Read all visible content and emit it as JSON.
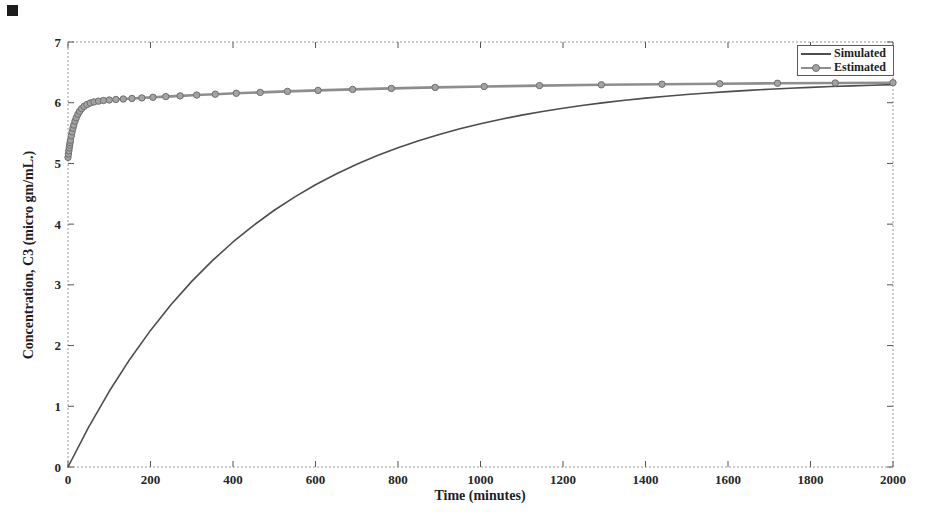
{
  "chart_data": {
    "type": "line",
    "title": "",
    "xlabel": "Time (minutes)",
    "ylabel": "Concentration, C3 (micro gm/mL.)",
    "xlim": [
      0,
      2000
    ],
    "ylim": [
      0,
      7
    ],
    "x_ticks": [
      0,
      200,
      400,
      600,
      800,
      1000,
      1200,
      1400,
      1600,
      1800,
      2000
    ],
    "y_ticks": [
      0,
      1,
      2,
      3,
      4,
      5,
      6,
      7
    ],
    "grid": false,
    "legend_position": "top-right",
    "axis_box_color": "#9a9a9a",
    "tick_color": "#555555",
    "series": [
      {
        "name": "Simulated",
        "color": "#4d4d4d",
        "line_width": 1.6,
        "marker": "none",
        "points": [
          [
            0,
            0
          ],
          [
            50,
            0.657
          ],
          [
            100,
            1.247
          ],
          [
            150,
            1.776
          ],
          [
            200,
            2.25
          ],
          [
            250,
            2.675
          ],
          [
            300,
            3.057
          ],
          [
            350,
            3.399
          ],
          [
            400,
            3.706
          ],
          [
            450,
            3.981
          ],
          [
            500,
            4.229
          ],
          [
            550,
            4.45
          ],
          [
            600,
            4.648
          ],
          [
            650,
            4.827
          ],
          [
            700,
            4.987
          ],
          [
            750,
            5.13
          ],
          [
            800,
            5.259
          ],
          [
            850,
            5.374
          ],
          [
            900,
            5.478
          ],
          [
            950,
            5.571
          ],
          [
            1000,
            5.654
          ],
          [
            1050,
            5.729
          ],
          [
            1100,
            5.796
          ],
          [
            1150,
            5.856
          ],
          [
            1200,
            5.91
          ],
          [
            1250,
            5.959
          ],
          [
            1300,
            6.002
          ],
          [
            1350,
            6.041
          ],
          [
            1400,
            6.076
          ],
          [
            1450,
            6.107
          ],
          [
            1500,
            6.135
          ],
          [
            1550,
            6.16
          ],
          [
            1600,
            6.183
          ],
          [
            1650,
            6.203
          ],
          [
            1700,
            6.222
          ],
          [
            1750,
            6.238
          ],
          [
            1800,
            6.252
          ],
          [
            1850,
            6.266
          ],
          [
            1900,
            6.277
          ],
          [
            1950,
            6.288
          ],
          [
            2000,
            6.298
          ]
        ]
      },
      {
        "name": "Estimated",
        "color": "#8e8e8e",
        "line_width": 2.6,
        "marker": "circle",
        "marker_radius": 3.2,
        "marker_fill": "#a3a3a3",
        "marker_stroke": "#6f6f6f",
        "points": [
          [
            0,
            5.1
          ],
          [
            1,
            5.155
          ],
          [
            2,
            5.207
          ],
          [
            3,
            5.255
          ],
          [
            4,
            5.301
          ],
          [
            5,
            5.344
          ],
          [
            6,
            5.383
          ],
          [
            8,
            5.456
          ],
          [
            10,
            5.52
          ],
          [
            12,
            5.581
          ],
          [
            14,
            5.632
          ],
          [
            17,
            5.697
          ],
          [
            20,
            5.752
          ],
          [
            24,
            5.811
          ],
          [
            28,
            5.857
          ],
          [
            33,
            5.902
          ],
          [
            39,
            5.94
          ],
          [
            46,
            5.971
          ],
          [
            54,
            5.995
          ],
          [
            63,
            6.013
          ],
          [
            74,
            6.026
          ],
          [
            86,
            6.036
          ],
          [
            100,
            6.045
          ],
          [
            116,
            6.053
          ],
          [
            134,
            6.061
          ],
          [
            155,
            6.07
          ],
          [
            179,
            6.079
          ],
          [
            206,
            6.089
          ],
          [
            237,
            6.101
          ],
          [
            272,
            6.113
          ],
          [
            312,
            6.126
          ],
          [
            357,
            6.14
          ],
          [
            408,
            6.155
          ],
          [
            466,
            6.17
          ],
          [
            532,
            6.186
          ],
          [
            606,
            6.203
          ],
          [
            690,
            6.219
          ],
          [
            784,
            6.236
          ],
          [
            890,
            6.252
          ],
          [
            1009,
            6.267
          ],
          [
            1143,
            6.282
          ],
          [
            1293,
            6.295
          ],
          [
            1440,
            6.305
          ],
          [
            1580,
            6.313
          ],
          [
            1720,
            6.32
          ],
          [
            1860,
            6.325
          ],
          [
            2000,
            6.33
          ]
        ]
      }
    ]
  },
  "legend": {
    "items": [
      {
        "label": "Simulated"
      },
      {
        "label": "Estimated"
      }
    ]
  }
}
